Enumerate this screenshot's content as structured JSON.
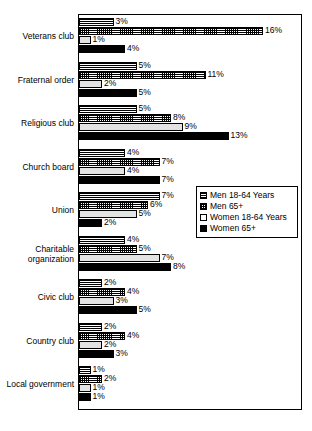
{
  "chart_data": {
    "type": "bar",
    "orientation": "horizontal",
    "title": "",
    "subtitle": "",
    "xlabel": "",
    "ylabel": "",
    "xlim": [
      0,
      19.5
    ],
    "grid": false,
    "legend_position": "middle-right",
    "value_suffix": "%",
    "categories": [
      "Veterans club",
      "Fraternal order",
      "Religious club",
      "Church board",
      "Union",
      "Charitable\norganization",
      "Civic club",
      "Country club",
      "Local government"
    ],
    "series": [
      {
        "name": "Men 18-64 Years",
        "pattern": "horizontal-lines",
        "values": [
          3,
          5,
          5,
          4,
          7,
          4,
          2,
          2,
          1
        ]
      },
      {
        "name": "Men 65+",
        "pattern": "cross-hatch",
        "values": [
          16,
          11,
          8,
          7,
          6,
          5,
          4,
          4,
          2
        ]
      },
      {
        "name": "Women 18-64 Years",
        "pattern": "white-solid",
        "values": [
          1,
          2,
          9,
          4,
          5,
          7,
          3,
          2,
          1
        ]
      },
      {
        "name": "Women 65+",
        "pattern": "black-solid",
        "values": [
          4,
          5,
          13,
          7,
          2,
          8,
          5,
          3,
          1
        ]
      }
    ],
    "data_labels": [
      {
        "category": "Veterans club",
        "Men 18-64 Years": "3%",
        "Men 65+": "16%",
        "Women 18-64 Years": "1%",
        "Women 65+": "4%"
      },
      {
        "category": "Fraternal order",
        "Men 18-64 Years": "5%",
        "Men 65+": "11%",
        "Women 18-64 Years": "2%",
        "Women 65+": "5%"
      },
      {
        "category": "Religious club",
        "Men 18-64 Years": "5%",
        "Men 65+": "8%",
        "Women 18-64 Years": "9%",
        "Women 65+": "13%"
      },
      {
        "category": "Church board",
        "Men 18-64 Years": "4%",
        "Men 65+": "7%",
        "Women 18-64 Years": "4%",
        "Women 65+": "7%"
      },
      {
        "category": "Union",
        "Men 18-64 Years": "7%",
        "Men 65+": "6%",
        "Women 18-64 Years": "5%",
        "Women 65+": "2%"
      },
      {
        "category": "Charitable organization",
        "Men 18-64 Years": "4%",
        "Men 65+": "5%",
        "Women 18-64 Years": "7%",
        "Women 65+": "8%"
      },
      {
        "category": "Civic club",
        "Men 18-64 Years": "2%",
        "Men 65+": "4%",
        "Women 18-64 Years": "3%",
        "Women 65+": "5%"
      },
      {
        "category": "Country club",
        "Men 18-64 Years": "2%",
        "Men 65+": "4%",
        "Women 18-64 Years": "2%",
        "Women 65+": "3%"
      },
      {
        "category": "Local government",
        "Men 18-64 Years": "1%",
        "Men 65+": "2%",
        "Women 18-64 Years": "1%",
        "Women 65+": "1%"
      }
    ]
  },
  "legend": {
    "items": [
      {
        "label": "Men 18-64 Years"
      },
      {
        "label": "Men 65+"
      },
      {
        "label": "Women 18-64 Years"
      },
      {
        "label": "Women 65+"
      }
    ]
  },
  "colors": {
    "axis": "#000000",
    "frame": "#000000",
    "series_men_18_64": "#ffffff",
    "series_men_65": "#ffffff",
    "series_women_18_64": "#e3e3e3",
    "series_women_65": "#000000",
    "text": "#000000",
    "background": "#ffffff"
  }
}
